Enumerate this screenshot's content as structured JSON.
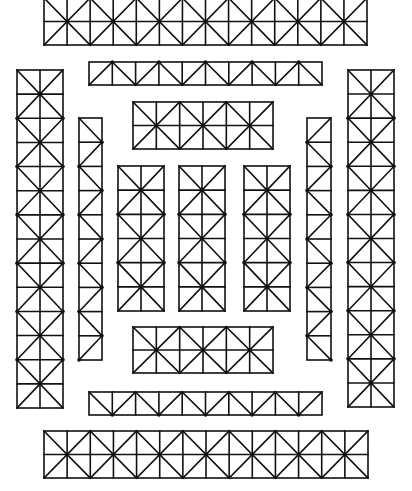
{
  "diagram": {
    "background": "#ffffff",
    "stroke": "#111111",
    "panels": [
      {
        "id": "top-strip",
        "orientation": "h",
        "pattern": "x",
        "x": 44,
        "y": -2,
        "w": 323,
        "h": 47,
        "cells": 14
      },
      {
        "id": "upper-thin-strip",
        "orientation": "h",
        "pattern": "zigzag-up",
        "x": 89,
        "y": 62,
        "w": 233,
        "h": 23,
        "cells": 10
      },
      {
        "id": "upper-box",
        "orientation": "h",
        "pattern": "x",
        "x": 133,
        "y": 102,
        "w": 140,
        "h": 47,
        "cells": 6
      },
      {
        "id": "left-tall-column",
        "orientation": "v",
        "pattern": "x",
        "x": 17,
        "y": 70,
        "w": 46,
        "h": 338,
        "cells": 14
      },
      {
        "id": "left-narrow-column",
        "orientation": "v",
        "pattern": "zigzag-left",
        "x": 79,
        "y": 118,
        "w": 23,
        "h": 242,
        "cells": 10
      },
      {
        "id": "inner-column-1",
        "orientation": "v",
        "pattern": "x",
        "x": 118,
        "y": 166,
        "w": 46,
        "h": 145,
        "cells": 6
      },
      {
        "id": "inner-column-2",
        "orientation": "v",
        "pattern": "x",
        "x": 179,
        "y": 166,
        "w": 46,
        "h": 145,
        "cells": 6
      },
      {
        "id": "inner-column-3",
        "orientation": "v",
        "pattern": "x",
        "x": 244,
        "y": 166,
        "w": 46,
        "h": 145,
        "cells": 6
      },
      {
        "id": "right-narrow-column",
        "orientation": "v",
        "pattern": "zigzag-right",
        "x": 307,
        "y": 118,
        "w": 24,
        "h": 242,
        "cells": 10
      },
      {
        "id": "right-tall-column",
        "orientation": "v",
        "pattern": "x",
        "x": 348,
        "y": 70,
        "w": 46,
        "h": 337,
        "cells": 14
      },
      {
        "id": "lower-box",
        "orientation": "h",
        "pattern": "x",
        "x": 133,
        "y": 327,
        "w": 140,
        "h": 46,
        "cells": 6
      },
      {
        "id": "lower-thin-strip",
        "orientation": "h",
        "pattern": "zigzag-down",
        "x": 89,
        "y": 392,
        "w": 233,
        "h": 23,
        "cells": 10
      },
      {
        "id": "bottom-strip",
        "orientation": "h",
        "pattern": "x",
        "x": 44,
        "y": 431,
        "w": 324,
        "h": 47,
        "cells": 14
      }
    ]
  }
}
